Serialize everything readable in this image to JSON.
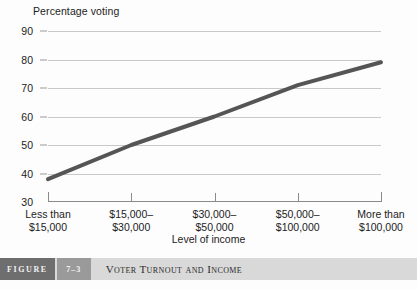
{
  "figure": {
    "label": "FIGURE",
    "number": "7–3",
    "title": "Voter Turnout and Income"
  },
  "chart_data": {
    "type": "line",
    "title": "Voter Turnout and Income",
    "xlabel": "Level of income",
    "ylabel": "Percentage voting",
    "categories": [
      "Less than\n$15,000",
      "$15,000–\n$30,000",
      "$30,000–\n$50,000",
      "$50,000–\n$100,000",
      "More than\n$100,000"
    ],
    "category_lines": [
      [
        "Less than",
        "$15,000"
      ],
      [
        "$15,000–",
        "$30,000"
      ],
      [
        "$30,000–",
        "$50,000"
      ],
      [
        "$50,000–",
        "$100,000"
      ],
      [
        "More than",
        "$100,000"
      ]
    ],
    "values": [
      38,
      50,
      60,
      71,
      79
    ],
    "ylim": [
      30,
      90
    ],
    "yticks": [
      30,
      40,
      50,
      60,
      70,
      80,
      90
    ],
    "ytick_labels": [
      "30",
      "40",
      "50",
      "60",
      "70",
      "80",
      "90"
    ],
    "grid": true,
    "legend": false,
    "series_color": "#555555",
    "grid_color": "#c9c9c9",
    "axis_color": "#8a8a8a"
  }
}
